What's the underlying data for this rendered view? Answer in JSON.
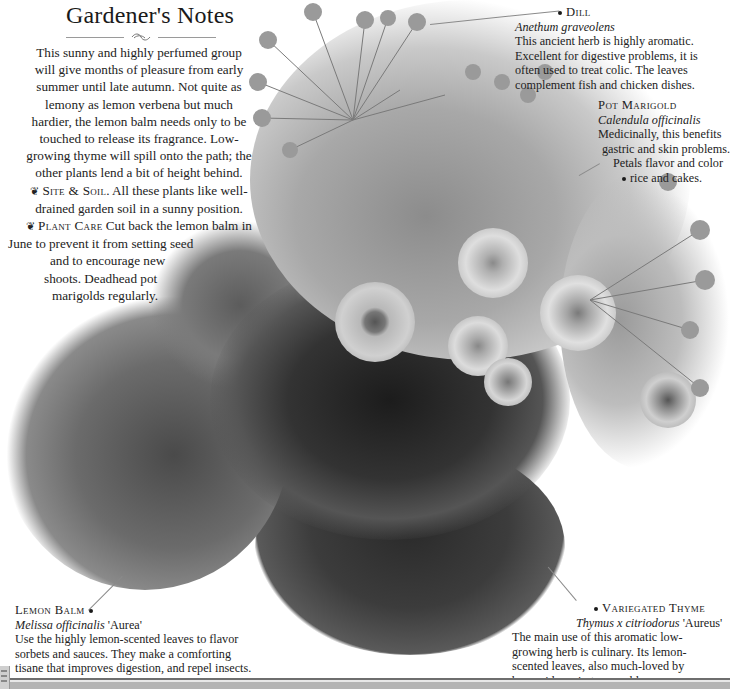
{
  "page": {
    "title": "Gardener's Notes",
    "intro": {
      "lines": [
        "This sunny and highly perfumed group",
        "will give months of pleasure from early",
        "summer until late autumn. Not quite as",
        "lemony as lemon verbena but much",
        "hardier, the lemon balm needs only to be",
        "touched to release its fragrance. Low-",
        "growing thyme will spill onto the path; the",
        "other plants lend a bit of height behind."
      ],
      "site_soil": {
        "bullet": "❦",
        "heading": "Site & Soil",
        "lines": [
          "All these plants like well-",
          "drained garden soil in a sunny position."
        ]
      },
      "plant_care": {
        "bullet": "❦",
        "heading": "Plant Care",
        "lines": [
          "Cut back the lemon balm in",
          "June to prevent it from setting seed",
          "and to encourage new",
          "shoots. Deadhead pot",
          "marigolds regularly."
        ]
      }
    },
    "callouts": {
      "dill": {
        "name": "Dill",
        "latin": "Anethum graveolens",
        "lines": [
          "This ancient herb is highly aromatic.",
          "Excellent for digestive problems, it is",
          "often used to treat colic. The leaves",
          "complement fish and chicken dishes."
        ]
      },
      "pot_marigold": {
        "name": "Pot Marigold",
        "latin": "Calendula officinalis",
        "lines": [
          "Medicinally, this benefits",
          "gastric and skin problems.",
          "Petals flavor and color",
          "rice and cakes."
        ]
      },
      "lemon_balm": {
        "name": "Lemon Balm",
        "latin": "Melissa officinalis",
        "cultivar": "'Aurea'",
        "lines": [
          "Use the highly lemon-scented leaves to flavor",
          "sorbets and sauces. They make a comforting",
          "tisane that improves digestion, and repel insects."
        ]
      },
      "variegated_thyme": {
        "name": "Variegated Thyme",
        "latin": "Thymus x citriodorus",
        "cultivar": "'Aureus'",
        "lines": [
          "The main use of this aromatic low-",
          "growing herb is culinary. Its lemon-",
          "scented leaves, also much-loved by",
          "bees, aid respiratory problems."
        ]
      }
    },
    "illustration": {
      "subject": "grayscale photograph of a herb planting: dill, pot marigold, lemon balm, variegated thyme",
      "colors": {
        "paper": "#ffffff",
        "text": "#1f1f1f",
        "leader": "#8a8a8a"
      }
    }
  }
}
